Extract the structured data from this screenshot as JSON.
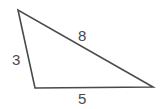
{
  "figure": {
    "name": "triangle-with-side-lengths",
    "background_color": "#ffffff",
    "stroke_color": "#4a4a4a",
    "label_color": "#4a4a4a",
    "stroke_width": 1.6,
    "width": 161,
    "height": 109
  },
  "chart_data": {
    "type": "diagram",
    "shape": "triangle",
    "title": "",
    "vertices": [
      {
        "name": "apex",
        "x": 18,
        "y": 10
      },
      {
        "name": "bottom-left",
        "x": 35,
        "y": 88
      },
      {
        "name": "bottom-right",
        "x": 153,
        "y": 87
      }
    ],
    "sides": [
      {
        "name": "top-right-side",
        "label": "8",
        "from": "apex",
        "to": "bottom-right",
        "label_x": 82,
        "label_y": 35
      },
      {
        "name": "left-side",
        "label": "3",
        "from": "apex",
        "to": "bottom-left",
        "label_x": 16,
        "label_y": 59
      },
      {
        "name": "bottom-side",
        "label": "5",
        "from": "bottom-left",
        "to": "bottom-right",
        "label_x": 82,
        "label_y": 98
      }
    ],
    "labels": [
      "8",
      "3",
      "5"
    ]
  },
  "labels": {
    "side_top": "8",
    "side_left": "3",
    "side_bottom": "5"
  }
}
